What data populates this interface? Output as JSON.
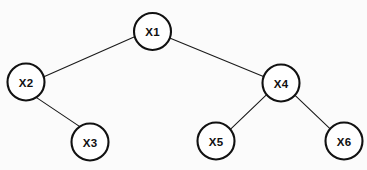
{
  "diagram": {
    "type": "tree",
    "title": "",
    "background_color": "#fbfbfb",
    "node_fill_color": "#ffffff",
    "node_stroke_color": "#111111",
    "edge_color": "#1a1a1a",
    "label_color": "#111111",
    "node_radius": 18.5,
    "nodes": [
      {
        "id": "X1",
        "label": "X1",
        "cx": 152.5,
        "cy": 31.5,
        "r": 18.5,
        "level": 0
      },
      {
        "id": "X2",
        "label": "X2",
        "cx": 26.0,
        "cy": 82.0,
        "r": 18.5,
        "level": 1
      },
      {
        "id": "X4",
        "label": "X4",
        "cx": 281.0,
        "cy": 83.0,
        "r": 18.5,
        "level": 1
      },
      {
        "id": "X3",
        "label": "X3",
        "cx": 90.0,
        "cy": 142.0,
        "r": 18.5,
        "level": 2
      },
      {
        "id": "X5",
        "label": "X5",
        "cx": 216.0,
        "cy": 141.0,
        "r": 18.5,
        "level": 2
      },
      {
        "id": "X6",
        "label": "X6",
        "cx": 344.0,
        "cy": 141.0,
        "r": 18.5,
        "level": 2
      }
    ],
    "edges": [
      {
        "id": "X1-X2",
        "from": "X1",
        "to": "X2",
        "x1": 134.6,
        "y1": 36.8,
        "x2": 43.9,
        "y2": 76.7
      },
      {
        "id": "X1-X4",
        "from": "X1",
        "to": "X4",
        "x1": 170.3,
        "y1": 38.2,
        "x2": 263.4,
        "y2": 76.6
      },
      {
        "id": "X2-X3",
        "from": "X2",
        "to": "X3",
        "x1": 36.2,
        "y1": 97.4,
        "x2": 79.8,
        "y2": 126.6
      },
      {
        "id": "X4-X5",
        "from": "X4",
        "to": "X5",
        "x1": 266.9,
        "y1": 94.3,
        "x2": 230.1,
        "y2": 129.7
      },
      {
        "id": "X4-X6",
        "from": "X4",
        "to": "X6",
        "x1": 294.8,
        "y1": 95.1,
        "x2": 330.2,
        "y2": 128.9
      }
    ]
  }
}
